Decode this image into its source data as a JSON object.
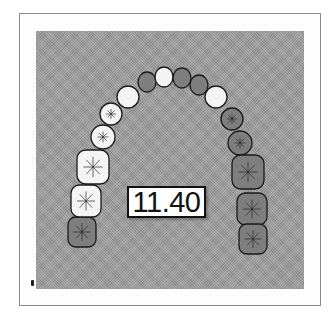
{
  "figure": {
    "type": "dental-arch-diagram",
    "measurement_label": "11.40",
    "colors": {
      "frame_border": "#8a8a8a",
      "panel": "#9c9c9c",
      "tooth_light": "#f4f4f4",
      "tooth_dark": "#7e7e7e",
      "outline": "#1a1a1a",
      "label_border": "#111111"
    },
    "teeth": [
      {
        "id": "L-molar-3",
        "side": "left",
        "type": "molar",
        "cx": 82,
        "cy": 232,
        "rx": 14,
        "ry": 15,
        "shade": "dark"
      },
      {
        "id": "L-molar-2",
        "side": "left",
        "type": "molar",
        "cx": 86,
        "cy": 201,
        "rx": 15,
        "ry": 16,
        "shade": "light"
      },
      {
        "id": "L-molar-1",
        "side": "left",
        "type": "molar",
        "cx": 93,
        "cy": 167,
        "rx": 16,
        "ry": 17,
        "shade": "light"
      },
      {
        "id": "L-premolar-2",
        "side": "left",
        "type": "premolar",
        "cx": 103,
        "cy": 137,
        "rx": 12,
        "ry": 12,
        "shade": "light"
      },
      {
        "id": "L-premolar-1",
        "side": "left",
        "type": "premolar",
        "cx": 111,
        "cy": 114,
        "rx": 11,
        "ry": 11,
        "shade": "light"
      },
      {
        "id": "L-canine",
        "side": "left",
        "type": "canine",
        "cx": 128,
        "cy": 97,
        "rx": 11,
        "ry": 11,
        "shade": "light"
      },
      {
        "id": "L-lateral-incisor",
        "side": "left",
        "type": "incisor",
        "cx": 147,
        "cy": 82,
        "rx": 9,
        "ry": 10,
        "shade": "dark"
      },
      {
        "id": "L-central-incisor",
        "side": "left",
        "type": "incisor",
        "cx": 164,
        "cy": 77,
        "rx": 9,
        "ry": 10,
        "shade": "light"
      },
      {
        "id": "R-central-incisor",
        "side": "right",
        "type": "incisor",
        "cx": 182,
        "cy": 78,
        "rx": 9,
        "ry": 10,
        "shade": "dark"
      },
      {
        "id": "R-lateral-incisor",
        "side": "right",
        "type": "incisor",
        "cx": 199,
        "cy": 85,
        "rx": 9,
        "ry": 10,
        "shade": "dark"
      },
      {
        "id": "R-canine",
        "side": "right",
        "type": "canine",
        "cx": 216,
        "cy": 97,
        "rx": 11,
        "ry": 11,
        "shade": "light"
      },
      {
        "id": "R-premolar-1",
        "side": "right",
        "type": "premolar",
        "cx": 232,
        "cy": 119,
        "rx": 11,
        "ry": 11,
        "shade": "dark"
      },
      {
        "id": "R-premolar-2",
        "side": "right",
        "type": "premolar",
        "cx": 240,
        "cy": 143,
        "rx": 12,
        "ry": 12,
        "shade": "dark"
      },
      {
        "id": "R-molar-1",
        "side": "right",
        "type": "molar",
        "cx": 248,
        "cy": 172,
        "rx": 16,
        "ry": 17,
        "shade": "dark"
      },
      {
        "id": "R-molar-2",
        "side": "right",
        "type": "molar",
        "cx": 252,
        "cy": 209,
        "rx": 15,
        "ry": 16,
        "shade": "dark"
      },
      {
        "id": "R-molar-3",
        "side": "right",
        "type": "molar",
        "cx": 253,
        "cy": 239,
        "rx": 14,
        "ry": 15,
        "shade": "dark"
      }
    ]
  }
}
